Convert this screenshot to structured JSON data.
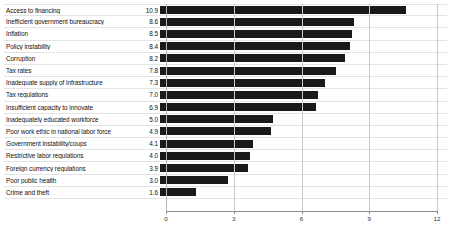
{
  "chart_data": {
    "type": "bar",
    "orientation": "horizontal",
    "title": "",
    "subtitle": "",
    "xlabel": "",
    "ylabel": "",
    "xlim": [
      0,
      12
    ],
    "xticks": [
      "0",
      "3",
      "6",
      "9",
      "12"
    ],
    "grid": true,
    "legend": null,
    "bar_color": "#1a1a1a",
    "gridline_color": "#c9c9c9",
    "separator_color": "#e3e3e3",
    "categories": [
      "Access to financing",
      "Inefficient government bureaucracy",
      "Inflation",
      "Policy instability",
      "Corruption",
      "Tax rates",
      "Inadequate supply of infrastructure",
      "Tax regulations",
      "Insufficient capacity to innovate",
      "Inadequately educated workforce",
      "Poor work ethic in national labor force",
      "Government instability/coups",
      "Restrictive labor regulations",
      "Foreign currency regulations",
      "Poor public health",
      "Crime and theft"
    ],
    "values": [
      10.9,
      8.6,
      8.5,
      8.4,
      8.2,
      7.8,
      7.3,
      7.0,
      6.9,
      5.0,
      4.9,
      4.1,
      4.0,
      3.9,
      3.0,
      1.6
    ],
    "value_labels": [
      "10.9",
      "8.6",
      "8.5",
      "8.4",
      "8.2",
      "7.8",
      "7.3",
      "7.0",
      "6.9",
      "5.0",
      "4.9",
      "4.1",
      "4.0",
      "3.9",
      "3.0",
      "1.6"
    ]
  }
}
